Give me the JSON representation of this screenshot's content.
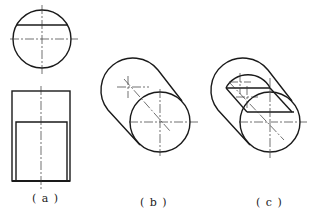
{
  "figure": {
    "views": [
      {
        "id": "a",
        "label": "( a )",
        "description": "Orthographic top and front views of a cylinder with a planar cut"
      },
      {
        "id": "b",
        "label": "( b )",
        "description": "Oblique sketch of solid cylinder"
      },
      {
        "id": "c",
        "label": "( c )",
        "description": "Oblique sketch of cylinder with slot cut"
      }
    ]
  },
  "colors": {
    "line": "#1a1a1a",
    "centerline": "#333333",
    "background": "#ffffff"
  }
}
